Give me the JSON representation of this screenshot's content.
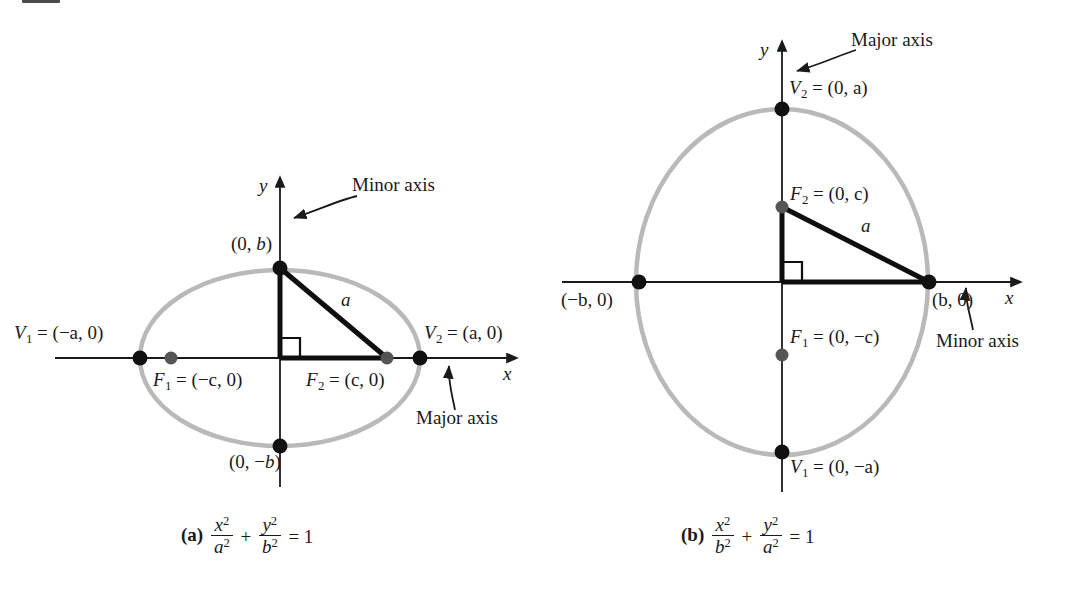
{
  "figure": {
    "background_color": "#ffffff",
    "ellipse_stroke_color": "#b9b9b9",
    "vertex_dot_color": "#111111",
    "focus_dot_color": "#555555",
    "axis_color": "#1a1a1a",
    "triangle_color": "#0f0f0f"
  },
  "panels": [
    {
      "id": "a",
      "caption_marker": "(a)",
      "caption_equation": {
        "term1_num": "x",
        "term1_den": "a",
        "operator": "+",
        "term2_num": "y",
        "term2_den": "b",
        "equals": "= 1",
        "exponent": "2",
        "plain": "x^2/a^2 + y^2/b^2 = 1"
      },
      "axis_x_label": "x",
      "axis_y_label": "y",
      "annotations": {
        "y_axis_note": "Minor axis",
        "x_axis_note": "Major axis"
      },
      "points": [
        {
          "name": "vertex-left",
          "label": "V₁ = (−a, 0)",
          "label_main": "V",
          "label_sub": "1",
          "label_rest": "= (−a, 0)",
          "kind": "vertex"
        },
        {
          "name": "vertex-right",
          "label": "V₂ = (a, 0)",
          "label_main": "V",
          "label_sub": "2",
          "label_rest": "= (a, 0)",
          "kind": "vertex"
        },
        {
          "name": "focus-left",
          "label": "F₁ = (−c, 0)",
          "label_main": "F",
          "label_sub": "1",
          "label_rest": "= (−c, 0)",
          "kind": "focus"
        },
        {
          "name": "focus-right",
          "label": "F₂ = (c, 0)",
          "label_main": "F",
          "label_sub": "2",
          "label_rest": "= (c, 0)",
          "kind": "focus"
        },
        {
          "name": "co-vertex-top",
          "label": "(0, b)",
          "kind": "vertex"
        },
        {
          "name": "co-vertex-bottom",
          "label": "(0, −b)",
          "kind": "vertex"
        }
      ],
      "segment_label": "a"
    },
    {
      "id": "b",
      "caption_marker": "(b)",
      "caption_equation": {
        "term1_num": "x",
        "term1_den": "b",
        "operator": "+",
        "term2_num": "y",
        "term2_den": "a",
        "equals": "= 1",
        "exponent": "2",
        "plain": "x^2/b^2 + y^2/a^2 = 1"
      },
      "axis_x_label": "x",
      "axis_y_label": "y",
      "annotations": {
        "y_axis_note": "Major axis",
        "x_axis_note": "Minor axis"
      },
      "points": [
        {
          "name": "vertex-top",
          "label": "V₂ = (0, a)",
          "label_main": "V",
          "label_sub": "2",
          "label_rest": "= (0, a)",
          "kind": "vertex"
        },
        {
          "name": "vertex-bottom",
          "label": "V₁ = (0, −a)",
          "label_main": "V",
          "label_sub": "1",
          "label_rest": "= (0, −a)",
          "kind": "vertex"
        },
        {
          "name": "focus-top",
          "label": "F₂ = (0, c)",
          "label_main": "F",
          "label_sub": "2",
          "label_rest": "= (0, c)",
          "kind": "focus"
        },
        {
          "name": "focus-bottom",
          "label": "F₁ = (0, −c)",
          "label_main": "F",
          "label_sub": "1",
          "label_rest": "= (0, −c)",
          "kind": "focus"
        },
        {
          "name": "co-vertex-left",
          "label": "(−b, 0)",
          "kind": "vertex"
        },
        {
          "name": "co-vertex-right",
          "label": "(b, 0)",
          "kind": "vertex"
        }
      ],
      "segment_label": "a"
    }
  ]
}
